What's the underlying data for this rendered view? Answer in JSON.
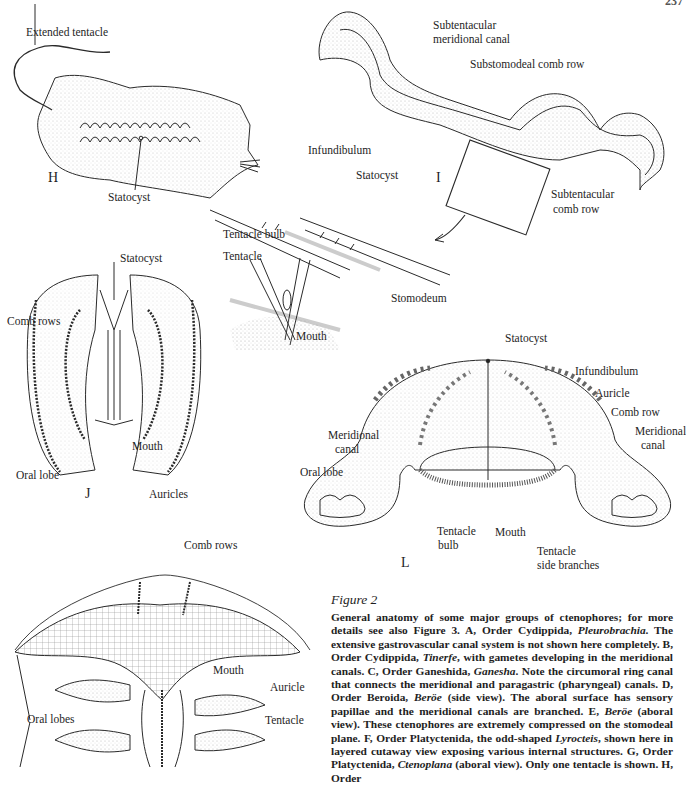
{
  "page_number": "237",
  "figures": {
    "H": {
      "letter": "H",
      "labels": {
        "extended_tentacle": "Extended tentacle",
        "statocyst": "Statocyst"
      }
    },
    "I": {
      "letter": "I",
      "labels": {
        "subtentacular_meridional_canal_1": "Subtentacular",
        "subtentacular_meridional_canal_2": "meridional canal",
        "substomodeal_comb_row": "Substomodeal comb row",
        "subtentacular_comb_row_1": "Subtentacular",
        "subtentacular_comb_row_2": "comb row",
        "infundibulum": "Infundibulum",
        "statocyst": "Statocyst",
        "tentacle_bulb": "Tentacle bulb",
        "tentacle": "Tentacle",
        "stomodeum": "Stomodeum",
        "mouth": "Mouth"
      }
    },
    "J": {
      "letter": "J",
      "labels": {
        "statocyst": "Statocyst",
        "comb_rows": "Comb rows",
        "mouth": "Mouth",
        "oral_lobe": "Oral lobe",
        "auricles": "Auricles"
      }
    },
    "L": {
      "letter": "L",
      "labels": {
        "statocyst": "Statocyst",
        "infundibulum": "Infundibulum",
        "auricle": "Auricle",
        "comb_row": "Comb row",
        "meridional_canal_left_1": "Meridional",
        "meridional_canal_left_2": "canal",
        "meridional_canal_right_1": "Meridional",
        "meridional_canal_right_2": "canal",
        "oral_lobe": "Oral lobe",
        "tentacle_bulb_1": "Tentacle",
        "tentacle_bulb_2": "bulb",
        "mouth": "Mouth",
        "tentacle_side_branches_1": "Tentacle",
        "tentacle_side_branches_2": "side branches"
      }
    },
    "K": {
      "labels": {
        "comb_rows": "Comb rows",
        "mouth": "Mouth",
        "auricle": "Auricle",
        "tentacle": "Tentacle",
        "oral_lobes": "Oral lobes"
      }
    }
  },
  "caption": {
    "title": "Figure 2",
    "segments": [
      {
        "t": "General anatomy of some major groups of ctenophores; for more details see also Figure 3. A, Order Cydippida, "
      },
      {
        "t": "Pleurobrachia",
        "i": true
      },
      {
        "t": ". The extensive gastrovascular canal system is not shown here completely. B, Order Cydippida, "
      },
      {
        "t": "Tinerfe",
        "i": true
      },
      {
        "t": ", with gametes developing in the meridional canals. C, Order Ganeshida, "
      },
      {
        "t": "Ganesha",
        "i": true
      },
      {
        "t": ". Note the circumoral ring canal that connects the meridional and paragastric (pharyngeal) canals. D, Order Beroida, "
      },
      {
        "t": "Beröe",
        "i": true
      },
      {
        "t": " (side view). The aboral surface has sensory papillae and the meridional canals are branched. E, "
      },
      {
        "t": "Beröe",
        "i": true
      },
      {
        "t": " (aboral view). These ctenophores are extremely compressed on the stomodeal plane. F, Order Platyctenida, the odd-shaped "
      },
      {
        "t": "Lyrocteis",
        "i": true
      },
      {
        "t": ", shown here in layered cutaway view exposing various internal structures. G, Order Platyctenida, "
      },
      {
        "t": "Ctenoplana",
        "i": true
      },
      {
        "t": " (aboral view). Only one tentacle is shown. H, Order"
      }
    ]
  }
}
